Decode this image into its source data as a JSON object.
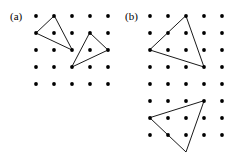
{
  "figure": {
    "background_color": "#ffffff",
    "ink_color": "#000000",
    "width": 239,
    "height": 162
  },
  "panels": [
    {
      "id": "a",
      "label": "(a)",
      "grid": {
        "columns": 5,
        "rows": 5,
        "origin_x": 36,
        "origin_y": 16,
        "spacing_x": 18,
        "spacing_y": 17,
        "dot_radius": 1.9
      },
      "shapes": [
        {
          "name": "triangle-a1",
          "kind": "triangle",
          "vertices": [
            [
              1,
              0
            ],
            [
              0,
              1
            ],
            [
              2,
              2
            ]
          ]
        },
        {
          "name": "triangle-a2",
          "kind": "triangle",
          "vertices": [
            [
              3,
              1
            ],
            [
              4,
              2
            ],
            [
              2,
              3
            ]
          ]
        }
      ]
    },
    {
      "id": "b",
      "label": "(b)",
      "grid": {
        "columns": 5,
        "rows": 8,
        "origin_x": 31,
        "origin_y": 16,
        "spacing_x": 18,
        "spacing_y": 17,
        "dot_radius": 1.9
      },
      "shapes": [
        {
          "name": "triangle-b1",
          "kind": "triangle",
          "vertices": [
            [
              2,
              0
            ],
            [
              3,
              3
            ],
            [
              0,
              2
            ]
          ]
        },
        {
          "name": "triangle-b2",
          "kind": "triangle",
          "vertices": [
            [
              3,
              5
            ],
            [
              2,
              8
            ],
            [
              0,
              6
            ]
          ]
        }
      ]
    }
  ]
}
